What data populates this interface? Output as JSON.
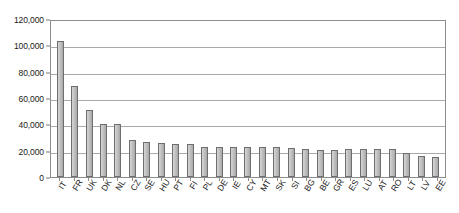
{
  "chart_data": {
    "type": "bar",
    "title": "",
    "subtitle": "",
    "xlabel": "",
    "ylabel": "",
    "ylim": [
      0,
      120000
    ],
    "ytick_labels": [
      "120,000",
      "100,000",
      "80,000",
      "60,000",
      "40,000",
      "20,000",
      "0"
    ],
    "ytick_values": [
      120000,
      100000,
      80000,
      60000,
      40000,
      20000,
      0
    ],
    "grid": true,
    "legend": "none",
    "categories": [
      "IT",
      "FR",
      "UK",
      "DK",
      "NL",
      "CZ",
      "SE",
      "HU",
      "PT",
      "FI",
      "PL",
      "DE",
      "IE",
      "CY",
      "MT",
      "SK",
      "SI",
      "BG",
      "BE",
      "GR",
      "ES",
      "LU",
      "AT",
      "RO",
      "LT",
      "LV",
      "EE"
    ],
    "values": [
      103000,
      69500,
      51000,
      40500,
      40000,
      27800,
      26800,
      26000,
      25000,
      25200,
      22700,
      22700,
      22700,
      22800,
      22800,
      22500,
      22000,
      21000,
      20700,
      20700,
      20900,
      20900,
      20900,
      21000,
      18500,
      16300,
      15200
    ],
    "series": [
      {
        "name": "Value",
        "values": [
          103000,
          69500,
          51000,
          40500,
          40000,
          27800,
          26800,
          26000,
          25000,
          25200,
          22700,
          22700,
          22700,
          22800,
          22800,
          22500,
          22000,
          21000,
          20700,
          20700,
          20900,
          20900,
          20900,
          21000,
          18500,
          16300,
          15200
        ]
      }
    ],
    "bar_color": "#bdbdbd",
    "bar_border_color": "#6e6e6e",
    "gridline_color": "#a9a9a9",
    "axis_color": "#8c8c8c"
  }
}
